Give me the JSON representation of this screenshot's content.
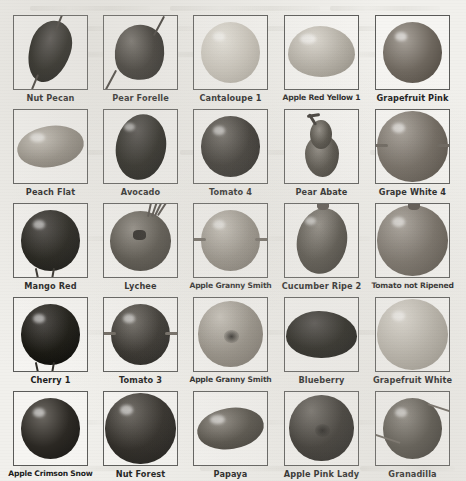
{
  "figure": {
    "type": "image-grid",
    "columns": 5,
    "rows": 5,
    "total_items": 25,
    "style": "grayscale scanned photographic plate",
    "background_color": "#f1f0ec",
    "frame_border_color": "#5a5a58",
    "caption_color": "#1c1c1c"
  },
  "items": [
    {
      "id": "r1c1",
      "label": "Nut Pecan",
      "row": 1,
      "col": 1,
      "shape": "oblong-pointed",
      "tone": "very-dark",
      "stem": "diagonal"
    },
    {
      "id": "r1c2",
      "label": "Pear Forelle",
      "row": 1,
      "col": 2,
      "shape": "pear",
      "tone": "dark",
      "stem": "diagonal"
    },
    {
      "id": "r1c3",
      "label": "Cantaloupe 1",
      "row": 1,
      "col": 3,
      "shape": "round",
      "tone": "very-light",
      "stem": "none"
    },
    {
      "id": "r1c4",
      "label": "Apple Red Yellow 1",
      "row": 1,
      "col": 4,
      "shape": "wide-round",
      "tone": "light",
      "stem": "none"
    },
    {
      "id": "r1c5",
      "label": "Grapefruit Pink",
      "row": 1,
      "col": 5,
      "shape": "round",
      "tone": "mid",
      "stem": "none"
    },
    {
      "id": "r2c1",
      "label": "Peach Flat",
      "row": 2,
      "col": 1,
      "shape": "flat-oval",
      "tone": "mid-light",
      "stem": "none"
    },
    {
      "id": "r2c2",
      "label": "Avocado",
      "row": 2,
      "col": 2,
      "shape": "oval",
      "tone": "very-dark",
      "stem": "none"
    },
    {
      "id": "r2c3",
      "label": "Tomato 4",
      "row": 2,
      "col": 3,
      "shape": "round",
      "tone": "dark",
      "stem": "none"
    },
    {
      "id": "r2c4",
      "label": "Pear Abate",
      "row": 2,
      "col": 4,
      "shape": "tall-pear",
      "tone": "mid-dark",
      "stem": "top-curved"
    },
    {
      "id": "r2c5",
      "label": "Grape White 4",
      "row": 2,
      "col": 5,
      "shape": "big-round",
      "tone": "mid",
      "stem": "side"
    },
    {
      "id": "r3c1",
      "label": "Mango Red",
      "row": 3,
      "col": 1,
      "shape": "round",
      "tone": "very-dark",
      "stem": "bottom"
    },
    {
      "id": "r3c2",
      "label": "Lychee",
      "row": 3,
      "col": 2,
      "shape": "bumpy-round",
      "tone": "mid-dark",
      "stem": "top-threads"
    },
    {
      "id": "r3c3",
      "label": "Apple Granny Smith",
      "row": 3,
      "col": 3,
      "shape": "round",
      "tone": "mid-light",
      "stem": "side"
    },
    {
      "id": "r3c4",
      "label": "Cucumber Ripe 2",
      "row": 3,
      "col": 4,
      "shape": "oval",
      "tone": "mid-dark",
      "stem": "top"
    },
    {
      "id": "r3c5",
      "label": "Tomato not Ripened",
      "row": 3,
      "col": 5,
      "shape": "big-round",
      "tone": "mid",
      "stem": "top"
    },
    {
      "id": "r4c1",
      "label": "Cherry 1",
      "row": 4,
      "col": 1,
      "shape": "round",
      "tone": "very-dark",
      "stem": "bottom"
    },
    {
      "id": "r4c2",
      "label": "Tomato 3",
      "row": 4,
      "col": 2,
      "shape": "round",
      "tone": "dark",
      "stem": "side"
    },
    {
      "id": "r4c3",
      "label": "Apple Granny Smith",
      "row": 4,
      "col": 3,
      "shape": "round-calyx",
      "tone": "mid-light",
      "stem": "none"
    },
    {
      "id": "r4c4",
      "label": "Blueberry",
      "row": 4,
      "col": 4,
      "shape": "wide-flat",
      "tone": "very-dark",
      "stem": "none"
    },
    {
      "id": "r4c5",
      "label": "Grapefruit White",
      "row": 4,
      "col": 5,
      "shape": "big-round",
      "tone": "light",
      "stem": "none"
    },
    {
      "id": "r5c1",
      "label": "Apple Crimson Snow",
      "row": 5,
      "col": 1,
      "shape": "round",
      "tone": "dark",
      "stem": "none"
    },
    {
      "id": "r5c2",
      "label": "Nut Forest",
      "row": 5,
      "col": 2,
      "shape": "big-round",
      "tone": "dark",
      "stem": "none"
    },
    {
      "id": "r5c3",
      "label": "Papaya",
      "row": 5,
      "col": 3,
      "shape": "flat-oval",
      "tone": "mid-dark",
      "stem": "none"
    },
    {
      "id": "r5c4",
      "label": "Apple Pink Lady",
      "row": 5,
      "col": 4,
      "shape": "round-calyx",
      "tone": "dark",
      "stem": "none"
    },
    {
      "id": "r5c5",
      "label": "Granadilla",
      "row": 5,
      "col": 5,
      "shape": "round",
      "tone": "mid-dark",
      "stem": "side-long"
    }
  ]
}
